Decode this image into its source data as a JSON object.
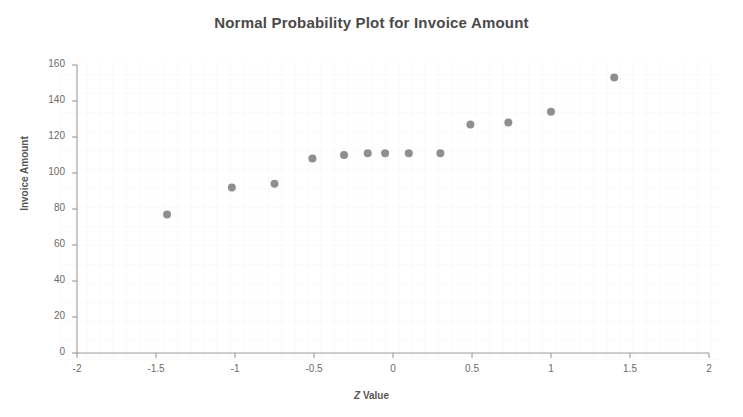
{
  "chart_data": {
    "type": "scatter",
    "title": "Normal Probability Plot for Invoice Amount",
    "xlabel": "Z Value",
    "ylabel": "Invoice Amount",
    "xlim": [
      -2,
      2
    ],
    "ylim": [
      0,
      160
    ],
    "xticks": [
      -2,
      -1.5,
      -1,
      -0.5,
      0,
      0.5,
      1,
      1.5,
      2
    ],
    "xtick_labels": [
      "-2",
      "-1.5",
      "-1",
      "-0.5",
      "0",
      "0.5",
      "1",
      "1.5",
      "2"
    ],
    "yticks": [
      0,
      20,
      40,
      60,
      80,
      100,
      120,
      140,
      160
    ],
    "ytick_labels": [
      "0",
      "20",
      "40",
      "60",
      "80",
      "100",
      "120",
      "140",
      "160"
    ],
    "grid": false,
    "legend": "none",
    "marker_color": "#8f8f8f",
    "marker_size": 4,
    "axis_color": "#909090",
    "series": [
      {
        "name": "Invoice Amount",
        "x": [
          -1.43,
          -1.02,
          -0.75,
          -0.51,
          -0.31,
          -0.16,
          -0.05,
          0.1,
          0.3,
          0.49,
          0.73,
          1.0,
          1.4
        ],
        "y": [
          77,
          92,
          94,
          108,
          110,
          111,
          111,
          111,
          111,
          127,
          128,
          134,
          153
        ]
      }
    ]
  }
}
